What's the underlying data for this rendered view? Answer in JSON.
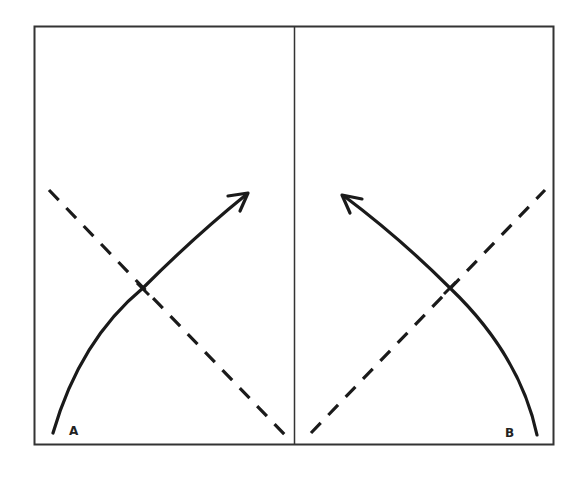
{
  "diagram": {
    "type": "two-panel directional flow diagram",
    "colors": {
      "ink": "#1a1a1a",
      "frame": "#333333",
      "background": "#ffffff"
    },
    "panels": [
      {
        "id": "left",
        "label": "A",
        "curve": "solid curved arrow rising from bottom-left toward upper-right",
        "dashed_line": "diagonal from upper-left to bottom-right",
        "crossing_tick": true
      },
      {
        "id": "right",
        "label": "B",
        "curve": "solid curved arrow rising from bottom-right toward upper-left",
        "dashed_line": "diagonal from upper-right to bottom-left",
        "crossing_tick": true
      }
    ]
  }
}
